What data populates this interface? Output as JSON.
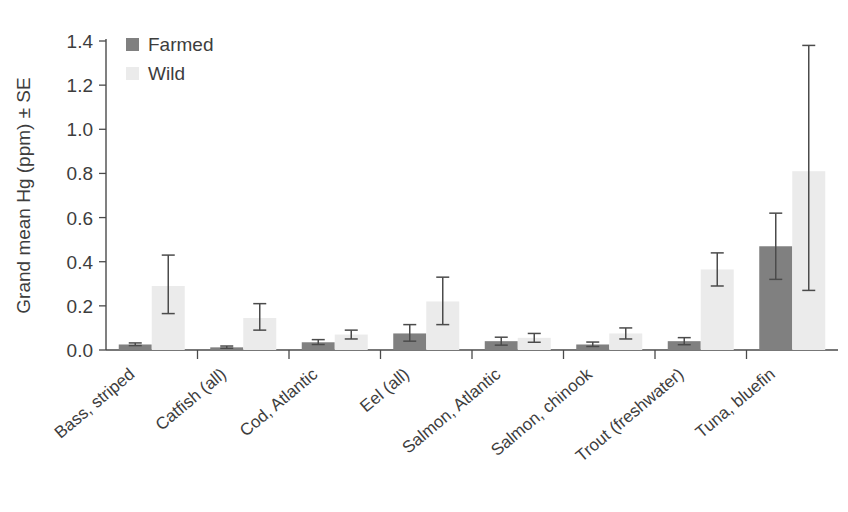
{
  "chart_data": {
    "type": "bar",
    "title": "",
    "subtitle": "",
    "xlabel": "",
    "ylabel": "Grand mean Hg (ppm) ± SE",
    "ylim": [
      0.0,
      1.4
    ],
    "ytick_labels": [
      "0.0",
      "0.2",
      "0.4",
      "0.6",
      "0.8",
      "1.0",
      "1.2",
      "1.4"
    ],
    "ytick_values": [
      0.0,
      0.2,
      0.4,
      0.6,
      0.8,
      1.0,
      1.2,
      1.4
    ],
    "grid": false,
    "legend_position": "top-left-inside",
    "categories": [
      "Bass, striped",
      "Catfish (all)",
      "Cod, Atlantic",
      "Eel (all)",
      "Salmon, Atlantic",
      "Salmon, chinook",
      "Trout (freshwater)",
      "Tuna, bluefin"
    ],
    "series": [
      {
        "name": "Farmed",
        "color": "#808080",
        "values": [
          0.025,
          0.012,
          0.035,
          0.075,
          0.04,
          0.025,
          0.04,
          0.47
        ],
        "err_low": [
          0.02,
          0.008,
          0.025,
          0.04,
          0.022,
          0.016,
          0.024,
          0.32
        ],
        "err_high": [
          0.032,
          0.018,
          0.047,
          0.115,
          0.058,
          0.036,
          0.056,
          0.62
        ]
      },
      {
        "name": "Wild",
        "color": "#ebebeb",
        "values": [
          0.29,
          0.145,
          0.07,
          0.22,
          0.055,
          0.075,
          0.365,
          0.81
        ],
        "err_low": [
          0.165,
          0.09,
          0.05,
          0.115,
          0.035,
          0.05,
          0.29,
          0.27
        ],
        "err_high": [
          0.43,
          0.21,
          0.09,
          0.33,
          0.075,
          0.1,
          0.44,
          1.38
        ]
      }
    ]
  },
  "legend": {
    "items": [
      {
        "label": "Farmed",
        "color": "#808080"
      },
      {
        "label": "Wild",
        "color": "#ebebeb"
      }
    ]
  },
  "axis": {
    "y_title": "Grand mean Hg (ppm) ± SE"
  }
}
